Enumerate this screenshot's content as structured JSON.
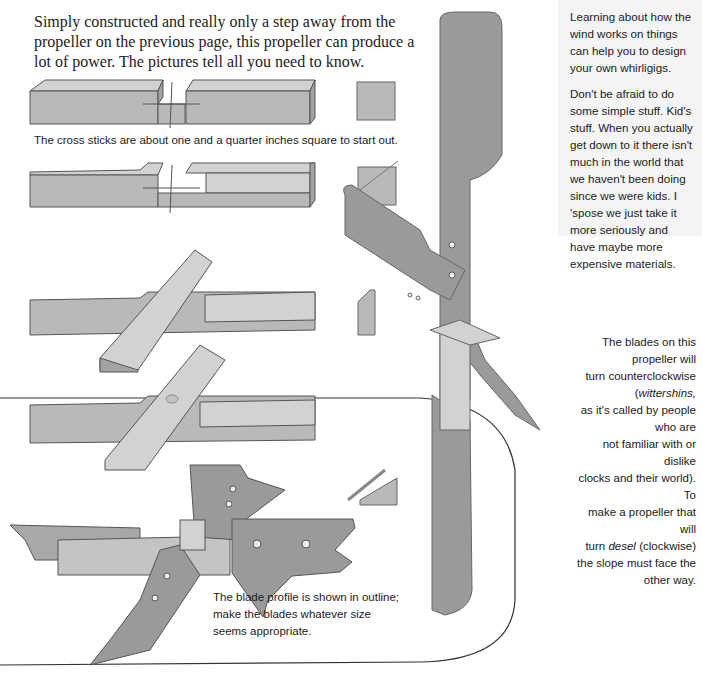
{
  "intro": {
    "text": "Simply constructed and really only a step away from the propeller on the previous page, this propeller can produce a lot of power. The pictures tell all you need to know."
  },
  "sidebar": {
    "paragraphs": [
      "Learning about how the wind works on things can help you to design your own whirligigs.",
      "Don't be afraid to do some simple stuff. Kid's stuff. When you actually get down to it there isn't much in the world that we haven't been doing since we were kids. I 'spose we just take it more seriously and have maybe more expensive materials."
    ]
  },
  "captions": {
    "cross_sticks": "The cross sticks are about one and a quarter inches square to start out.",
    "blades_rotation": {
      "line1": "The blades on this propeller will",
      "line2_pre": "turn counterclockwise (",
      "line2_em": "wittershins,",
      "line3": "as it's called by people who are",
      "line4": "not familiar with or dislike",
      "line5": "clocks and their world). To",
      "line6": "make a propeller that will",
      "line7_pre": "turn ",
      "line7_em": "desel",
      "line7_post": " (clockwise)",
      "line8": "the slope must face the",
      "line9": "other way."
    },
    "blade_profile": "The blade profile is shown in outline; make the blades whatever size seems appropriate."
  },
  "illustrations": {
    "step1": "notched-stick-with-end-square",
    "step2": "notched-stick-with-diagonal-end",
    "step3": "cross-sticks-joined",
    "step4": "cross-sticks-with-pivot-hole",
    "step5": "blades-attached-outline",
    "screw_detail": "screw-in-bevel-detail",
    "assembled": "assembled-propeller"
  },
  "colors": {
    "wood": "#b9b9b9",
    "wood_light": "#d2d2d2",
    "wood_dark": "#a3a3a3",
    "blade": "#9a9a9a",
    "outline": "#555555",
    "sidebar_bg": "#f4f4f4"
  }
}
